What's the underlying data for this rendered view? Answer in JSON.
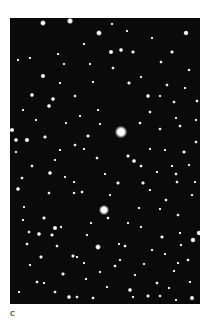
{
  "figure": {
    "panel_label": "c",
    "background_color": "#0a0a0a",
    "star_color": "#ffffff",
    "panel": {
      "x": 10,
      "y": 18,
      "width": 190,
      "height": 286
    }
  },
  "stars": [
    [
      121,
      132,
      5.5
    ],
    [
      104,
      210,
      4.5
    ],
    [
      98,
      247,
      2.6
    ],
    [
      43,
      23,
      2.6
    ],
    [
      70,
      21,
      2.8
    ],
    [
      99,
      33,
      2.6
    ],
    [
      186,
      33,
      2.4
    ],
    [
      111,
      52,
      2.2
    ],
    [
      121,
      50,
      2.0
    ],
    [
      133,
      52,
      1.8
    ],
    [
      148,
      96,
      2.0
    ],
    [
      129,
      83,
      1.8
    ],
    [
      43,
      76,
      2.2
    ],
    [
      32,
      95,
      2.0
    ],
    [
      53,
      99,
      2.0
    ],
    [
      49,
      106,
      2.0
    ],
    [
      75,
      96,
      1.6
    ],
    [
      60,
      83,
      1.4
    ],
    [
      93,
      82,
      1.4
    ],
    [
      161,
      62,
      1.6
    ],
    [
      172,
      52,
      1.8
    ],
    [
      113,
      68,
      1.6
    ],
    [
      167,
      85,
      1.6
    ],
    [
      189,
      70,
      1.5
    ],
    [
      197,
      101,
      1.6
    ],
    [
      112,
      24,
      1.4
    ],
    [
      84,
      44,
      1.4
    ],
    [
      174,
      102,
      1.6
    ],
    [
      160,
      96,
      1.4
    ],
    [
      27,
      140,
      2.2
    ],
    [
      16,
      140,
      2.0
    ],
    [
      45,
      137,
      1.8
    ],
    [
      16,
      152,
      1.4
    ],
    [
      32,
      166,
      1.6
    ],
    [
      75,
      145,
      1.6
    ],
    [
      88,
      136,
      1.8
    ],
    [
      84,
      149,
      1.4
    ],
    [
      97,
      158,
      1.6
    ],
    [
      128,
      156,
      1.8
    ],
    [
      134,
      161,
      2.0
    ],
    [
      141,
      166,
      1.6
    ],
    [
      140,
      123,
      1.6
    ],
    [
      150,
      112,
      1.6
    ],
    [
      160,
      129,
      1.6
    ],
    [
      180,
      126,
      1.6
    ],
    [
      184,
      152,
      1.8
    ],
    [
      176,
      174,
      1.6
    ],
    [
      196,
      142,
      1.6
    ],
    [
      196,
      120,
      1.4
    ],
    [
      118,
      183,
      1.8
    ],
    [
      143,
      183,
      1.8
    ],
    [
      157,
      172,
      1.4
    ],
    [
      177,
      182,
      1.6
    ],
    [
      166,
      200,
      1.6
    ],
    [
      192,
      195,
      1.4
    ],
    [
      172,
      166,
      1.4
    ],
    [
      50,
      173,
      2.0
    ],
    [
      22,
      178,
      1.6
    ],
    [
      18,
      189,
      2.0
    ],
    [
      49,
      193,
      1.6
    ],
    [
      74,
      193,
      1.5
    ],
    [
      74,
      182,
      1.3
    ],
    [
      65,
      177,
      1.3
    ],
    [
      82,
      192,
      1.6
    ],
    [
      55,
      228,
      2.2
    ],
    [
      44,
      218,
      1.8
    ],
    [
      39,
      234,
      2.0
    ],
    [
      52,
      235,
      1.8
    ],
    [
      29,
      232,
      1.6
    ],
    [
      57,
      246,
      1.6
    ],
    [
      61,
      227,
      1.4
    ],
    [
      27,
      244,
      1.6
    ],
    [
      41,
      257,
      1.8
    ],
    [
      73,
      256,
      1.8
    ],
    [
      63,
      274,
      1.8
    ],
    [
      77,
      257,
      1.4
    ],
    [
      37,
      282,
      1.6
    ],
    [
      44,
      283,
      1.4
    ],
    [
      55,
      292,
      1.6
    ],
    [
      69,
      297,
      2.0
    ],
    [
      77,
      297,
      1.6
    ],
    [
      93,
      298,
      1.6
    ],
    [
      130,
      290,
      2.0
    ],
    [
      133,
      297,
      1.4
    ],
    [
      148,
      296,
      1.8
    ],
    [
      160,
      296,
      1.5
    ],
    [
      169,
      288,
      1.4
    ],
    [
      192,
      298,
      2.2
    ],
    [
      190,
      282,
      1.4
    ],
    [
      174,
      271,
      1.4
    ],
    [
      157,
      283,
      1.6
    ],
    [
      115,
      266,
      1.6
    ],
    [
      125,
      246,
      1.6
    ],
    [
      108,
      218,
      1.6
    ],
    [
      128,
      223,
      1.4
    ],
    [
      141,
      227,
      1.4
    ],
    [
      162,
      237,
      1.8
    ],
    [
      178,
      215,
      1.6
    ],
    [
      193,
      240,
      2.4
    ],
    [
      188,
      260,
      1.6
    ],
    [
      139,
      208,
      1.4
    ],
    [
      160,
      209,
      1.4
    ],
    [
      180,
      233,
      1.4
    ],
    [
      181,
      245,
      1.4
    ],
    [
      152,
      250,
      1.4
    ],
    [
      120,
      260,
      1.4
    ],
    [
      100,
      272,
      1.4
    ],
    [
      86,
      279,
      1.4
    ],
    [
      23,
      220,
      1.4
    ],
    [
      30,
      265,
      1.4
    ],
    [
      19,
      292,
      1.4
    ],
    [
      87,
      235,
      1.3
    ],
    [
      91,
      223,
      1.3
    ],
    [
      119,
      244,
      1.3
    ],
    [
      144,
      264,
      1.3
    ],
    [
      165,
      254,
      1.3
    ],
    [
      178,
      263,
      1.3
    ],
    [
      135,
      275,
      1.3
    ],
    [
      58,
      54,
      1.3
    ],
    [
      30,
      58,
      1.3
    ],
    [
      23,
      110,
      1.3
    ],
    [
      66,
      123,
      1.3
    ],
    [
      80,
      116,
      1.3
    ],
    [
      98,
      110,
      1.3
    ],
    [
      141,
      77,
      1.3
    ],
    [
      185,
      88,
      1.3
    ],
    [
      60,
      150,
      1.3
    ],
    [
      36,
      120,
      1.3
    ],
    [
      105,
      174,
      1.3
    ],
    [
      150,
      149,
      1.3
    ],
    [
      165,
      150,
      1.3
    ],
    [
      189,
      165,
      1.3
    ],
    [
      12,
      130,
      2.2
    ],
    [
      199,
      233,
      2.4
    ],
    [
      152,
      38,
      1.3
    ],
    [
      127,
      31,
      1.3
    ],
    [
      18,
      60,
      1.2
    ],
    [
      64,
      64,
      1.2
    ],
    [
      90,
      64,
      1.2
    ],
    [
      176,
      118,
      1.2
    ],
    [
      100,
      124,
      1.2
    ],
    [
      55,
      160,
      1.2
    ],
    [
      24,
      207,
      1.2
    ],
    [
      110,
      195,
      1.2
    ],
    [
      150,
      190,
      1.2
    ],
    [
      195,
      182,
      1.2
    ],
    [
      84,
      263,
      1.2
    ],
    [
      107,
      287,
      1.2
    ],
    [
      176,
      300,
      1.2
    ]
  ]
}
